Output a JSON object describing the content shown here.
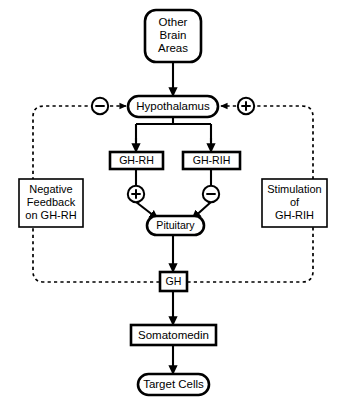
{
  "diagram": {
    "colors": {
      "background": "#ffffff",
      "stroke": "#000000",
      "fill": "#ffffff"
    },
    "nodes": {
      "other_brain_areas": {
        "label_line1": "Other",
        "label_line2": "Brain",
        "label_line3": "Areas",
        "shape": "rounded-rectangle"
      },
      "hypothalamus": {
        "label": "Hypothalamus",
        "shape": "stadium"
      },
      "gh_rh": {
        "label": "GH-RH",
        "shape": "rectangle"
      },
      "gh_rih": {
        "label": "GH-RIH",
        "shape": "rectangle"
      },
      "pituitary": {
        "label": "Pituitary",
        "shape": "stadium"
      },
      "gh": {
        "label": "GH",
        "shape": "rectangle"
      },
      "somatomedin": {
        "label": "Somatomedin",
        "shape": "rectangle"
      },
      "target_cells": {
        "label": "Target Cells",
        "shape": "stadium"
      },
      "negative_feedback": {
        "label_line1": "Negative",
        "label_line2": "Feedback",
        "label_line3": "on GH-RH",
        "shape": "rectangle"
      },
      "stimulation": {
        "label_line1": "Stimulation",
        "label_line2": "of",
        "label_line3": "GH-RIH",
        "shape": "rectangle"
      }
    },
    "signs": {
      "minus_hypothalamus": "−",
      "plus_hypothalamus": "+",
      "plus_pituitary": "+",
      "minus_pituitary": "−"
    },
    "edges": [
      {
        "from": "other_brain_areas",
        "to": "hypothalamus",
        "style": "solid",
        "arrow": true
      },
      {
        "from": "hypothalamus",
        "to": "gh_rh",
        "style": "solid",
        "arrow": true
      },
      {
        "from": "hypothalamus",
        "to": "gh_rih",
        "style": "solid",
        "arrow": true
      },
      {
        "from": "gh_rh",
        "to": "pituitary",
        "style": "solid",
        "arrow": true,
        "sign": "+"
      },
      {
        "from": "gh_rih",
        "to": "pituitary",
        "style": "solid",
        "arrow": true,
        "sign": "−"
      },
      {
        "from": "pituitary",
        "to": "gh",
        "style": "solid",
        "arrow": true
      },
      {
        "from": "gh",
        "to": "somatomedin",
        "style": "solid",
        "arrow": true
      },
      {
        "from": "somatomedin",
        "to": "target_cells",
        "style": "solid",
        "arrow": true
      },
      {
        "from": "gh",
        "to": "hypothalamus",
        "style": "dashed",
        "arrow": true,
        "via": "negative_feedback",
        "sign": "−"
      },
      {
        "from": "gh",
        "to": "hypothalamus",
        "style": "dashed",
        "arrow": true,
        "via": "stimulation",
        "sign": "+"
      }
    ]
  }
}
